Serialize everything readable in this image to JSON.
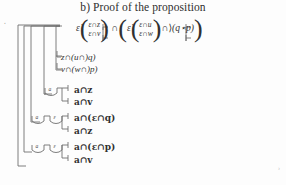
{
  "document": {
    "title": "b) Proof of the proposition",
    "corner_mark_top_left": "‘",
    "corner_mark_bottom_right": "›"
  },
  "proof": {
    "main_formula": {
      "left_operator": "ε̇",
      "left_branch_top": "ε∩z",
      "left_branch_bottom": "ε∩v",
      "connective": "∩",
      "right_operator": "ε̇",
      "right_branch_top": "ε∩u",
      "right_branch_bottom": "ε∩w",
      "tail_connective": "∩⟩",
      "tail_term": "(q⋆p)",
      "rendered": "ε̇( ε∩z / ε∩v ) ∩ ( ε̇( ε∩u / ε∩w ) ∩⟩(q⋆p) )"
    },
    "rows": [
      {
        "id": "row-z",
        "text": "z∩(u∩)q)"
      },
      {
        "id": "row-v",
        "text": "v∩(w∩)p)"
      },
      {
        "id": "row-az",
        "text": "a∩z"
      },
      {
        "id": "row-av",
        "text": "a∩v"
      },
      {
        "id": "row-aeq",
        "text": "a∩(ε∩q)"
      },
      {
        "id": "row-az2",
        "text": "a∩z"
      },
      {
        "id": "row-aep",
        "text": "a∩(ε∩p)"
      },
      {
        "id": "row-av2",
        "text": "a∩v"
      }
    ],
    "branch_labels": [
      {
        "id": "label-a-1",
        "text": "a"
      },
      {
        "id": "label-a-2",
        "text": "a"
      },
      {
        "id": "label-eps-1",
        "text": "ε"
      },
      {
        "id": "label-a-3",
        "text": "a"
      },
      {
        "id": "label-eps-2",
        "text": "ε"
      }
    ]
  },
  "colors": {
    "ink": "#303030",
    "rule": "#6f6f6f",
    "page": "#fdfdfd",
    "faint": "#b5b5b5"
  }
}
